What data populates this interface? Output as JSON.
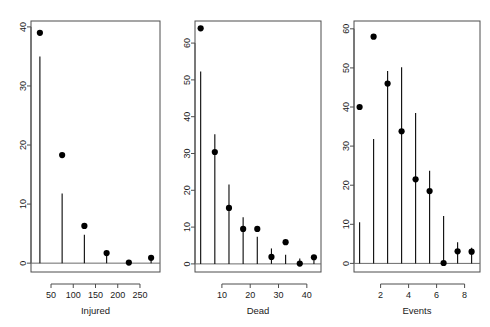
{
  "figure": {
    "title": "",
    "background": "#ffffff",
    "panel_count": 3
  },
  "chart_data": [
    {
      "type": "scatter",
      "title": "",
      "subtitle": "",
      "xlabel": "Injured",
      "ylabel": "",
      "xlim": [
        5,
        295
      ],
      "ylim": [
        -1.5,
        41
      ],
      "xticks": [
        50,
        100,
        150,
        200,
        250
      ],
      "yticks": [
        0,
        10,
        20,
        30,
        40
      ],
      "grid": false,
      "legend": "none",
      "annotations": [],
      "x": [
        25,
        75,
        125,
        175,
        225,
        275
      ],
      "values": [
        39.0,
        18.3,
        6.3,
        1.7,
        0.1,
        0.9
      ],
      "error_bar_low": [
        0.0,
        0.0,
        0.0,
        0.0,
        0.0,
        0.0
      ],
      "error_bar_high": [
        35.0,
        11.8,
        4.8,
        1.3,
        0.5,
        0.4
      ]
    },
    {
      "type": "scatter",
      "title": "",
      "subtitle": "",
      "xlabel": "Dead",
      "ylabel": "",
      "xlim": [
        0.5,
        45
      ],
      "ylim": [
        -2.2,
        66
      ],
      "xticks": [
        10,
        20,
        30,
        40
      ],
      "yticks": [
        0,
        10,
        20,
        30,
        40,
        50,
        60
      ],
      "grid": false,
      "legend": "none",
      "annotations": [],
      "x": [
        2.5,
        7.5,
        12.5,
        17.5,
        22.5,
        27.5,
        32.5,
        37.5,
        42.5
      ],
      "values": [
        64.0,
        30.4,
        15.2,
        9.5,
        9.5,
        1.9,
        5.9,
        0.1,
        1.8
      ],
      "error_bar_low": [
        0.0,
        0.0,
        0.0,
        0.0,
        0.0,
        0.0,
        0.0,
        0.0,
        0.0
      ],
      "error_bar_high": [
        52.3,
        35.2,
        21.6,
        12.7,
        7.4,
        4.2,
        2.5,
        1.5,
        1.0
      ]
    },
    {
      "type": "scatter",
      "title": "",
      "subtitle": "",
      "xlabel": "Events",
      "ylabel": "",
      "xlim": [
        0.1,
        9.1
      ],
      "ylim": [
        -2.2,
        62
      ],
      "xticks": [
        2,
        4,
        6,
        8
      ],
      "yticks": [
        0,
        10,
        20,
        30,
        40,
        50,
        60
      ],
      "grid": false,
      "legend": "none",
      "annotations": [],
      "x": [
        0.5,
        1.5,
        2.5,
        3.5,
        4.5,
        5.5,
        6.5,
        7.5,
        8.5
      ],
      "values": [
        40.0,
        58.0,
        46.0,
        33.8,
        21.5,
        18.5,
        0.1,
        3.1,
        3.0
      ],
      "error_bar_low": [
        0.0,
        0.0,
        0.0,
        0.0,
        0.0,
        0.0,
        0.0,
        0.0,
        0.0
      ],
      "error_bar_high": [
        10.5,
        31.8,
        49.2,
        50.2,
        38.5,
        23.7,
        12.1,
        5.4,
        4.0
      ]
    }
  ]
}
